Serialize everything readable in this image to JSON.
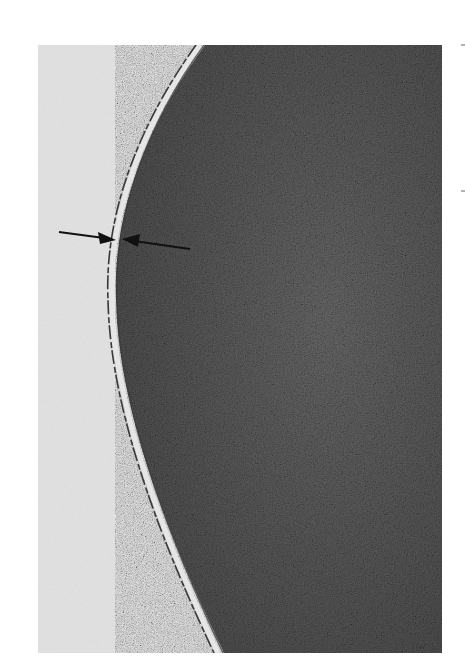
{
  "figure": {
    "kind": "electron micrograph",
    "colors": {
      "background": "#ffffff",
      "exterior": "#dcdcdc",
      "interior": "#555555",
      "membrane_dark": "#333333",
      "membrane_light": "#e4e4e4",
      "arrow": "#111111"
    },
    "annotations": [
      {
        "type": "arrow",
        "direction": "right",
        "points_to": "outer membrane edge"
      },
      {
        "type": "arrow",
        "direction": "left",
        "points_to": "inner membrane edge"
      }
    ],
    "margin_marks": 2
  }
}
